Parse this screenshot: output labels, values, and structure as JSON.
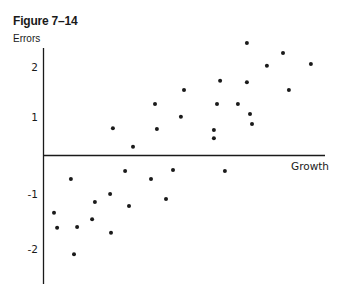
{
  "figure": {
    "title": "Figure 7–14"
  },
  "chart_data": {
    "type": "scatter",
    "title": "Figure 7–14",
    "xlabel": "Growth",
    "ylabel": "Errors",
    "x_ticks": [],
    "y_ticks": [
      2,
      1,
      -1,
      -2
    ],
    "y_tick_labels": [
      "2",
      "1",
      "-1",
      "-2"
    ],
    "xlim": [
      0,
      10
    ],
    "ylim": [
      -2.8,
      2.4
    ],
    "grid": false,
    "legend": null,
    "marker_color": "#1a1a1a",
    "points": [
      {
        "x": 0.39,
        "y": -1.27
      },
      {
        "x": 0.5,
        "y": -1.6
      },
      {
        "x": 0.99,
        "y": -0.53
      },
      {
        "x": 1.1,
        "y": -2.18
      },
      {
        "x": 1.21,
        "y": -1.58
      },
      {
        "x": 1.74,
        "y": -1.41
      },
      {
        "x": 1.84,
        "y": -1.03
      },
      {
        "x": 2.38,
        "y": -0.86
      },
      {
        "x": 2.41,
        "y": -1.71
      },
      {
        "x": 2.48,
        "y": 0.59
      },
      {
        "x": 2.91,
        "y": -0.35
      },
      {
        "x": 3.05,
        "y": -1.12
      },
      {
        "x": 3.19,
        "y": 0.18
      },
      {
        "x": 3.83,
        "y": -0.53
      },
      {
        "x": 3.97,
        "y": 1.12
      },
      {
        "x": 4.04,
        "y": 0.57
      },
      {
        "x": 4.36,
        "y": -0.97
      },
      {
        "x": 4.61,
        "y": -0.33
      },
      {
        "x": 4.89,
        "y": 0.84
      },
      {
        "x": 5.0,
        "y": 1.43
      },
      {
        "x": 6.06,
        "y": 0.55
      },
      {
        "x": 6.06,
        "y": 0.37
      },
      {
        "x": 6.17,
        "y": 1.12
      },
      {
        "x": 6.28,
        "y": 1.63
      },
      {
        "x": 6.45,
        "y": -0.35
      },
      {
        "x": 6.91,
        "y": 1.12
      },
      {
        "x": 7.23,
        "y": 2.46
      },
      {
        "x": 7.23,
        "y": 1.6
      },
      {
        "x": 7.34,
        "y": 0.9
      },
      {
        "x": 7.41,
        "y": 0.68
      },
      {
        "x": 7.94,
        "y": 1.96
      },
      {
        "x": 8.51,
        "y": 2.24
      },
      {
        "x": 8.72,
        "y": 1.43
      },
      {
        "x": 9.5,
        "y": 2.0
      }
    ]
  }
}
